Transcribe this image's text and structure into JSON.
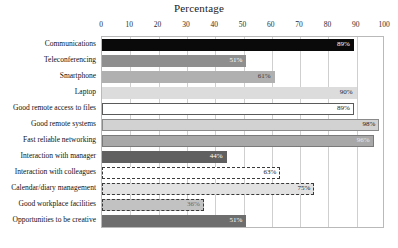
{
  "chart_data": {
    "type": "bar",
    "orientation": "horizontal",
    "title": "Percentage",
    "xlabel": "",
    "ylabel": "",
    "xlim": [
      0,
      100
    ],
    "xticks": [
      0,
      10,
      20,
      30,
      40,
      50,
      60,
      70,
      80,
      90,
      100
    ],
    "grid": true,
    "legend": "none",
    "categories": [
      "Communications",
      "Teleconferencing",
      "Smartphone",
      "Laptop",
      "Good remote access to files",
      "Good remote systems",
      "Fast reliable networking",
      "Interaction with manager",
      "Interaction with colleagues",
      "Calendar/diary management",
      "Good workplace facilities",
      "Opportunities to be creative"
    ],
    "values": [
      89,
      51,
      61,
      90,
      89,
      98,
      96,
      44,
      63,
      75,
      36,
      51
    ],
    "data_labels": [
      "89%",
      "51%",
      "61%",
      "90%",
      "89%",
      "98%",
      "96%",
      "44%",
      "63%",
      "75%",
      "36%",
      "51%"
    ],
    "bar_styles": [
      {
        "fill": "#0a0a0a",
        "border": "#0a0a0a",
        "border_style": "solid",
        "label_color": "#ffffff"
      },
      {
        "fill": "#8f8f8f",
        "border": "#8f8f8f",
        "border_style": "solid",
        "label_color": "#ffffff"
      },
      {
        "fill": "#b0b0b0",
        "border": "#b0b0b0",
        "border_style": "solid",
        "label_color": "#3a3a3a"
      },
      {
        "fill": "#dcdcdc",
        "border": "#dcdcdc",
        "border_style": "solid",
        "label_color": "#2a2a2a"
      },
      {
        "fill": "#ffffff",
        "border": "#5a5a5a",
        "border_style": "solid",
        "label_color": "#1a1a1a"
      },
      {
        "fill": "#d2d2d2",
        "border": "#8a8a8a",
        "border_style": "solid",
        "label_color": "#1a1a1a"
      },
      {
        "fill": "#a8a8a8",
        "border": "#7a7a7a",
        "border_style": "solid",
        "label_color": "#e8e8e8"
      },
      {
        "fill": "#606060",
        "border": "#606060",
        "border_style": "solid",
        "label_color": "#ffffff"
      },
      {
        "fill": "#ffffff",
        "border": "#3a3a3a",
        "border_style": "dashed",
        "label_color": "#1a1a1a"
      },
      {
        "fill": "#e2e2e2",
        "border": "#3a3a3a",
        "border_style": "dashed",
        "label_color": "#1a1a1a"
      },
      {
        "fill": "#c2c2c2",
        "border": "#3a3a3a",
        "border_style": "dashed",
        "label_color": "#6a6a6a"
      },
      {
        "fill": "#6e6e6e",
        "border": "#6e6e6e",
        "border_style": "solid",
        "label_color": "#ffffff"
      }
    ]
  },
  "colors": {
    "plot_border": "#b9b9b9",
    "gridline": "#cfcfcf",
    "background": "#ffffff",
    "text": "#111111"
  }
}
